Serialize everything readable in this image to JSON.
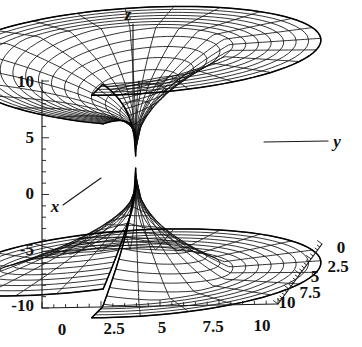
{
  "figure": {
    "title": "",
    "background_color": "#ffffff",
    "line_color": "#111111",
    "width": 362,
    "height": 347
  },
  "axes": {
    "z_axis": {
      "name": "z",
      "ticks": [
        "10",
        "5",
        "0",
        "-5",
        "-10"
      ],
      "values": [
        10,
        5,
        0,
        -5,
        -10
      ],
      "range": [
        -10,
        10
      ]
    },
    "x_axis": {
      "name": "x",
      "ticks": [
        "0",
        "2.5",
        "5",
        "7.5",
        "10"
      ],
      "values": [
        0,
        2.5,
        5,
        7.5,
        10
      ],
      "range": [
        0,
        10
      ]
    },
    "y_axis": {
      "name": "y",
      "ticks": [
        "0",
        "2.5",
        "5",
        "7.5",
        "10"
      ],
      "values": [
        0,
        2.5,
        5,
        7.5,
        10
      ],
      "range": [
        0,
        10
      ]
    }
  },
  "chart_data": {
    "type": "line",
    "plot_kind": "3d-surface-wireframe",
    "title": "",
    "xlabel": "x",
    "ylabel": "y",
    "zlabel": "z",
    "xlim": [
      0,
      10
    ],
    "ylim": [
      0,
      10
    ],
    "zlim": [
      -10,
      10
    ],
    "x_ticks": [
      0,
      2.5,
      5,
      7.5,
      10
    ],
    "x_tick_labels": [
      "0",
      "2.5",
      "5",
      "7.5",
      "10"
    ],
    "y_ticks": [
      0,
      2.5,
      5,
      7.5,
      10
    ],
    "y_tick_labels": [
      "0",
      "2.5",
      "5",
      "7.5",
      "10"
    ],
    "z_ticks": [
      -10,
      -5,
      0,
      5,
      10
    ],
    "z_tick_labels": [
      "10",
      "5",
      "0",
      "-5",
      "-10"
    ],
    "grid": false,
    "legend": false,
    "legend_position": "none",
    "mesh_u_lines": 24,
    "mesh_v_lines": 14,
    "sheets": 2,
    "annotations": [
      {
        "text": "z",
        "role": "axis-label",
        "position": "top"
      },
      {
        "text": "y",
        "role": "axis-label",
        "position": "right"
      },
      {
        "text": "x",
        "role": "axis-label",
        "position": "left"
      }
    ]
  },
  "labels": {
    "z_name": "z",
    "y_name": "y",
    "x_name": "x",
    "z_t0": "10",
    "z_t1": "5",
    "z_t2": "0",
    "z_t3": "-5",
    "z_t4": "-10",
    "x_t0": "0",
    "x_t1": "2.5",
    "x_t2": "5",
    "x_t3": "7.5",
    "x_t4": "10",
    "y_t0": "0",
    "y_t1": "2.5",
    "y_t2": "5",
    "y_t3": "7.5",
    "y_t4": "10"
  }
}
